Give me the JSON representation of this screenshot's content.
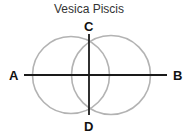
{
  "title": "Vesica Piscis",
  "labels": {
    "A": "A",
    "B": "B",
    "C": "C",
    "D": "D"
  },
  "colors": {
    "circle_stroke": "#b3b3b3",
    "line_stroke": "#1a1a1a",
    "text": "#111111",
    "background": "#ffffff"
  },
  "geometry": {
    "circle_left": {
      "cx": 71,
      "cy": 75,
      "r": 39
    },
    "circle_right": {
      "cx": 111,
      "cy": 75,
      "r": 40
    },
    "line_AB": {
      "x1": 24,
      "y1": 75,
      "x2": 167,
      "y2": 75
    },
    "line_CD": {
      "x1": 89,
      "y1": 34,
      "x2": 89,
      "y2": 115
    }
  }
}
